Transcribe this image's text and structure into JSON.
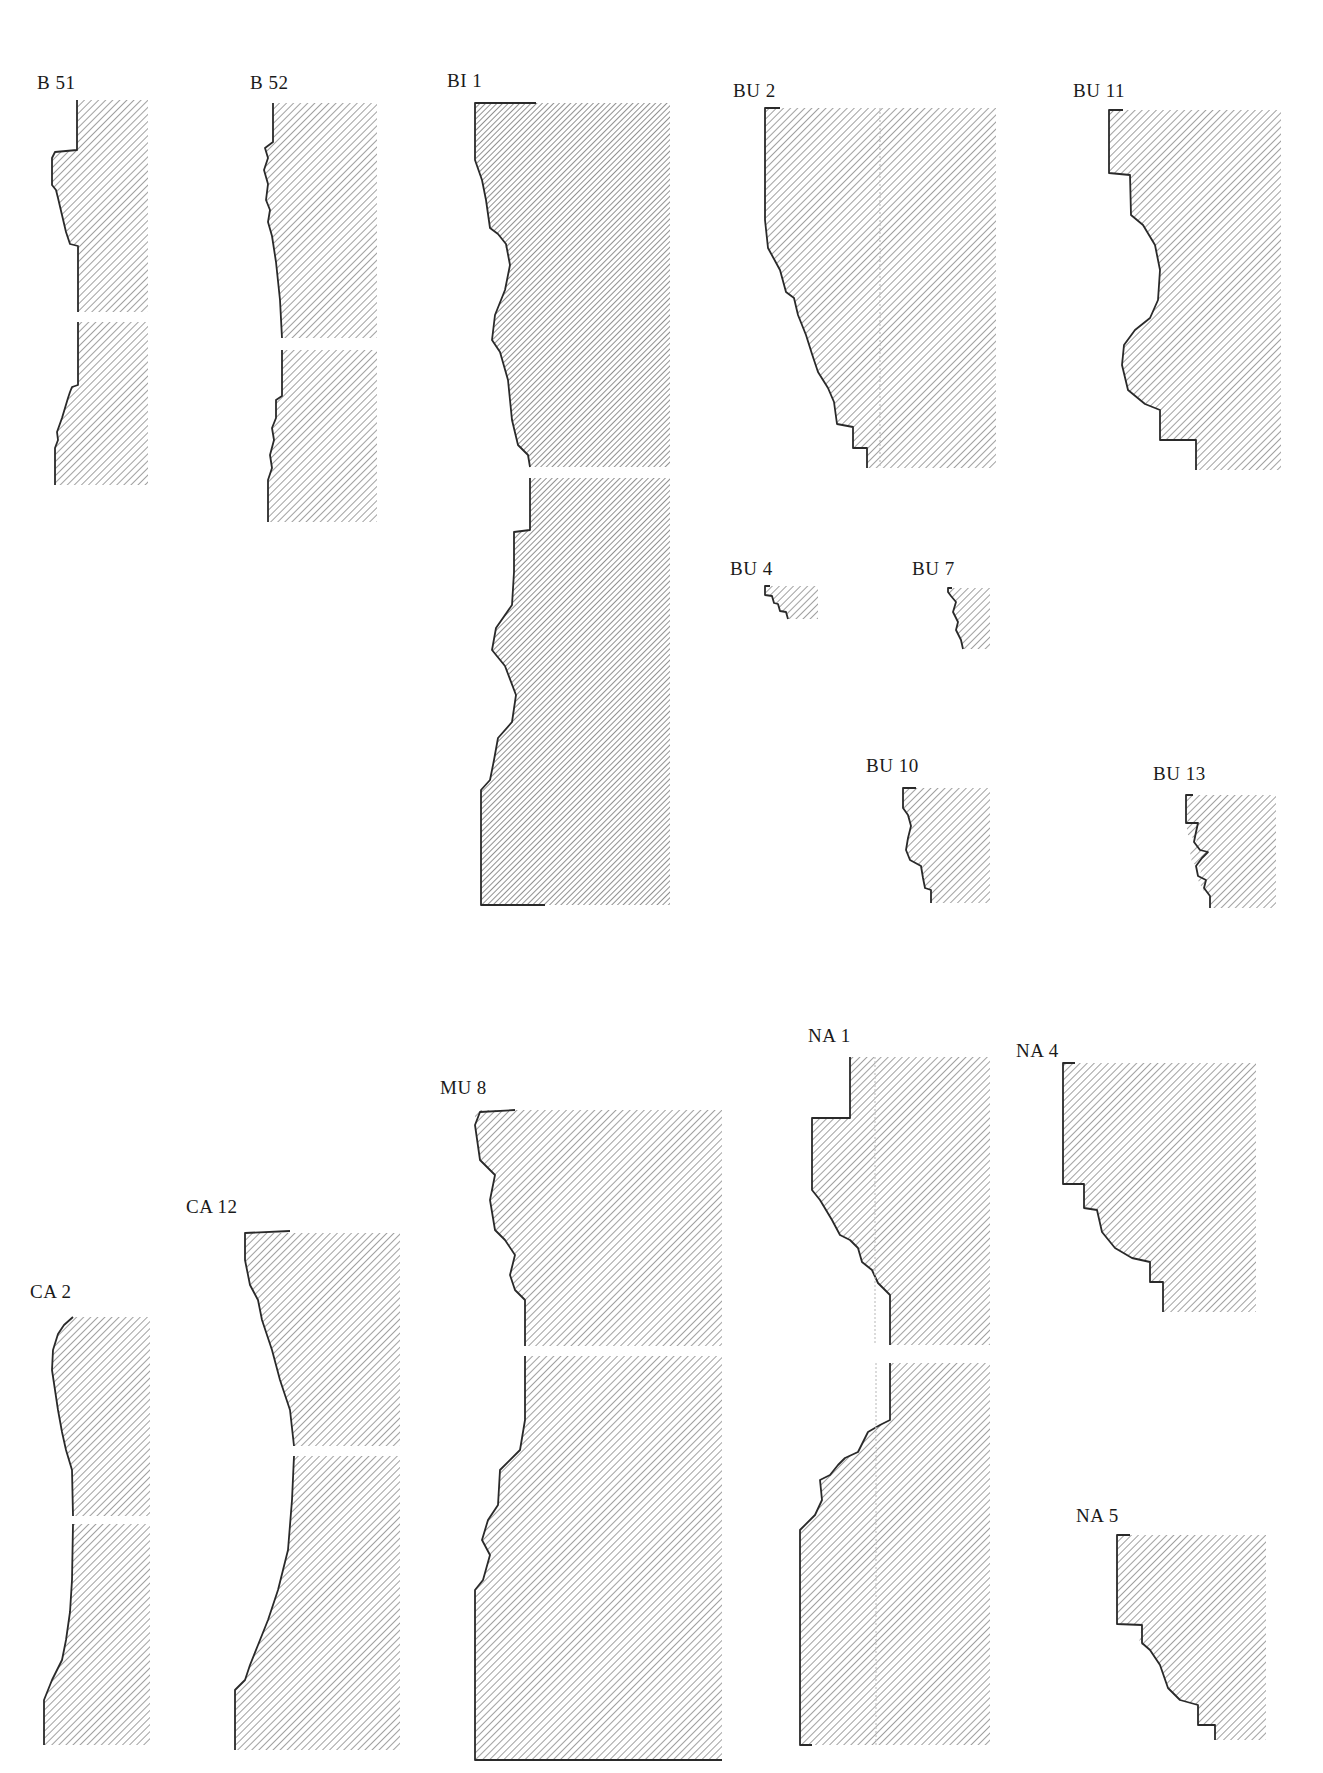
{
  "page": {
    "type": "architectural molding profile plate",
    "background": "#ffffff",
    "ink_color": "#2a2a2a"
  },
  "profiles": [
    {
      "id": "b51",
      "label": "B 51",
      "pieces": 2
    },
    {
      "id": "b52",
      "label": "B 52",
      "pieces": 2
    },
    {
      "id": "bi1",
      "label": "BI 1",
      "pieces": 2
    },
    {
      "id": "bu2",
      "label": "BU 2",
      "pieces": 1
    },
    {
      "id": "bu11",
      "label": "BU 11",
      "pieces": 1
    },
    {
      "id": "bu4",
      "label": "BU 4",
      "pieces": 1
    },
    {
      "id": "bu7",
      "label": "BU 7",
      "pieces": 1
    },
    {
      "id": "bu10",
      "label": "BU 10",
      "pieces": 1
    },
    {
      "id": "bu13",
      "label": "BU 13",
      "pieces": 1
    },
    {
      "id": "ca2",
      "label": "CA 2",
      "pieces": 2
    },
    {
      "id": "ca12",
      "label": "CA 12",
      "pieces": 2
    },
    {
      "id": "mu8",
      "label": "MU 8",
      "pieces": 2
    },
    {
      "id": "na1",
      "label": "NA 1",
      "pieces": 2
    },
    {
      "id": "na4",
      "label": "NA 4",
      "pieces": 1
    },
    {
      "id": "na5",
      "label": "NA 5",
      "pieces": 1
    }
  ]
}
